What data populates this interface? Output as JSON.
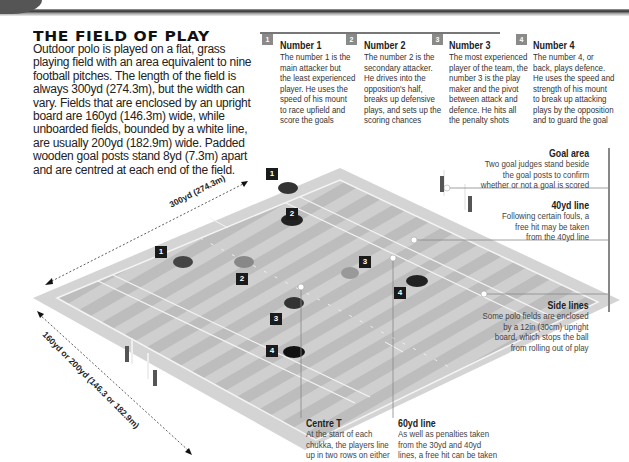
{
  "header": {
    "title": "THE FIELD OF PLAY",
    "intro_lines": [
      "Outdoor polo is played on a flat, grass",
      "playing field with an area equivalent to nine",
      "football pitches. The length of the field is",
      "always 300yd (274.3m), but the width can",
      "vary. Fields that are enclosed by an upright",
      "board are 160yd (146.3m) wide, while",
      "unboarded fields, bounded by a white line,",
      "are usually 200yd (182.9m) wide. Padded",
      "wooden goal posts stand 8yd (7.3m) apart",
      "and are centred at each end of the field."
    ]
  },
  "roles": [
    {
      "badge": "1",
      "title": "Number 1",
      "lines": [
        "The number 1 is the",
        "main attacker but",
        "the least experienced",
        "player. He uses the",
        "speed of his mount",
        "to race upfield and",
        "score the goals"
      ]
    },
    {
      "badge": "2",
      "title": "Number 2",
      "lines": [
        "The number 2 is the",
        "secondary attacker.",
        "He drives into the",
        "opposition's half,",
        "breaks up defensive",
        "plays, and sets up the",
        "scoring chances"
      ]
    },
    {
      "badge": "3",
      "title": "Number 3",
      "lines": [
        "The most experienced",
        "player of the team, the",
        "number 3 is the play",
        "maker and the pivot",
        "between attack and",
        "defence. He hits all",
        "the penalty shots"
      ]
    },
    {
      "badge": "4",
      "title": "Number 4",
      "lines": [
        "The number 4, or",
        "back, plays defence.",
        "He uses the speed and",
        "strength of his mount",
        "to break up attacking",
        "plays by the opposition",
        "and to guard the goal"
      ]
    }
  ],
  "callouts": {
    "goal_area": {
      "title": "Goal area",
      "lines": [
        "Two goal judges stand beside",
        "the goal posts to confirm",
        "whether or not a goal is scored"
      ]
    },
    "line_40yd": {
      "title": "40yd line",
      "lines": [
        "Following certain fouls, a",
        "free hit may be taken",
        "from the 40yd line"
      ]
    },
    "side_lines": {
      "title": "Side lines",
      "lines": [
        "Some polo fields are enclosed",
        "by a 12in (30cm) upright",
        "board, which stops the ball",
        "from rolling out of play"
      ]
    },
    "centre_t": {
      "title": "Centre T",
      "lines": [
        "At the start of each",
        "chukka, the players line",
        "up in two rows on either",
        "side of the centre T"
      ]
    },
    "line_60yd": {
      "title": "60yd line",
      "lines": [
        "As well as penalties taken",
        "from the 30yd and 40yd",
        "lines, a free hit can be taken",
        "further away from the goal"
      ]
    }
  },
  "dimensions": {
    "length": "300yd (274.3m)",
    "width": "160yd or 200yd (146.3 or 182.9m)"
  },
  "player_markers": [
    {
      "label": "1",
      "team": "dark",
      "x": 266,
      "y": 168
    },
    {
      "label": "2",
      "team": "dark",
      "x": 286,
      "y": 208
    },
    {
      "label": "1",
      "team": "light",
      "x": 155,
      "y": 246
    },
    {
      "label": "2",
      "team": "light",
      "x": 236,
      "y": 273
    },
    {
      "label": "3",
      "team": "light",
      "x": 359,
      "y": 256
    },
    {
      "label": "4",
      "team": "dark",
      "x": 394,
      "y": 287
    },
    {
      "label": "3",
      "team": "dark",
      "x": 270,
      "y": 313
    },
    {
      "label": "4",
      "team": "light",
      "x": 266,
      "y": 345
    }
  ]
}
